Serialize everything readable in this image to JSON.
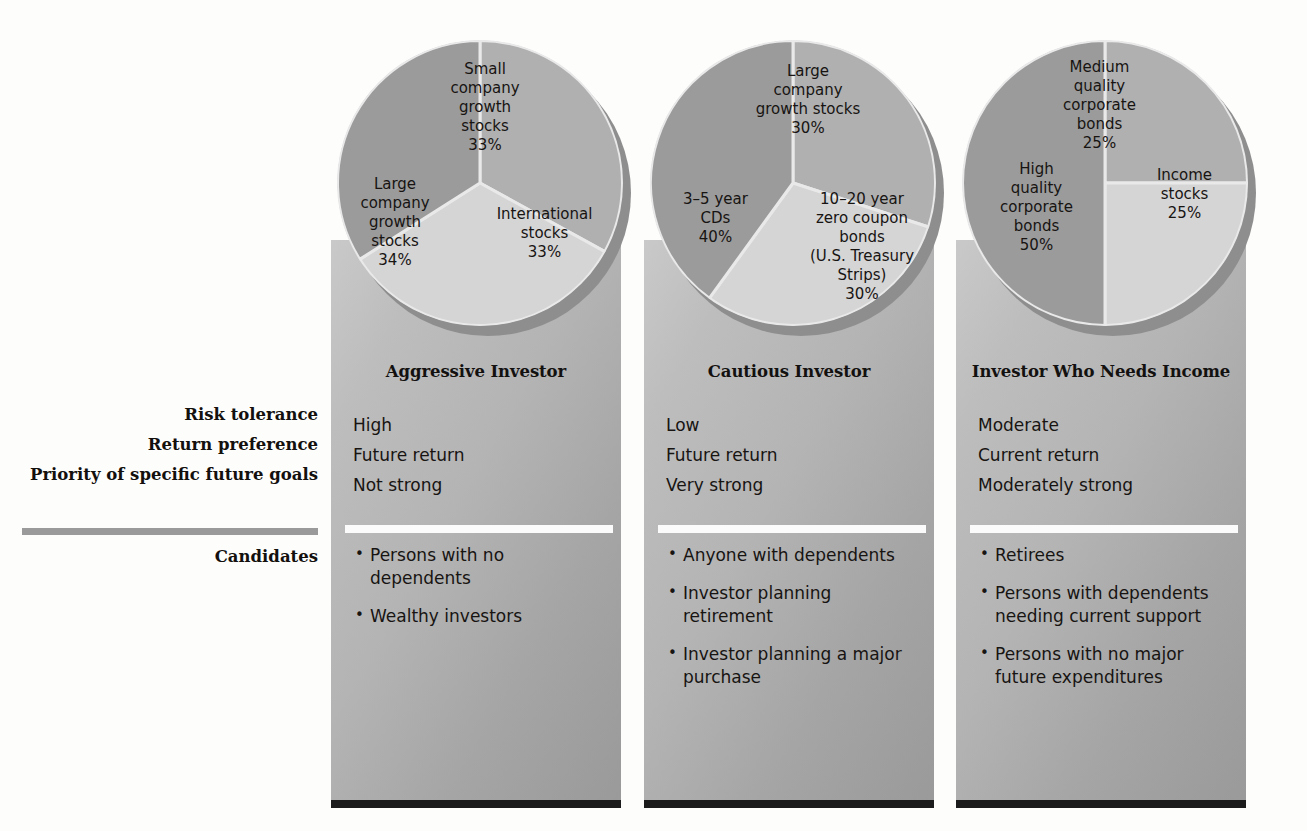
{
  "row_labels": [
    "Risk tolerance",
    "Return preference",
    "Priority of specific future goals"
  ],
  "candidates_label": "Candidates",
  "colors": {
    "slice_dark": "#9b9b9b",
    "slice_mid": "#b0b0b0",
    "slice_light": "#d5d5d5",
    "panel_top": "#c9c9c9",
    "panel_bottom": "#9a9a9a",
    "shadow": "#1b1b1b",
    "rule_gray": "#9a9a9a",
    "rule_white": "#fbfbfb",
    "text": "#171412"
  },
  "chart_data": [
    {
      "type": "pie",
      "title": "Aggressive Investor",
      "categories": [
        "Small company growth stocks",
        "International stocks",
        "Large company growth stocks"
      ],
      "values": [
        33,
        33,
        34
      ],
      "labels": [
        "Small\ncompany\ngrowth\nstocks\n33%",
        "International\nstocks\n33%",
        "Large\ncompany\ngrowth\nstocks\n34%"
      ],
      "value_labels": [
        "33%",
        "33%",
        "34%"
      ],
      "colors": [
        "#b0b0b0",
        "#d5d5d5",
        "#9b9b9b"
      ],
      "legend": "none",
      "grid": false
    },
    {
      "type": "pie",
      "title": "Cautious Investor",
      "categories": [
        "Large company growth stocks",
        "10–20 year zero coupon bonds (U.S. Treasury Strips)",
        "3–5 year CDs"
      ],
      "values": [
        30,
        30,
        40
      ],
      "labels": [
        "Large\ncompany\ngrowth stocks\n30%",
        "10–20 year\nzero coupon\nbonds\n(U.S. Treasury\nStrips)\n30%",
        "3–5 year\nCDs\n40%"
      ],
      "value_labels": [
        "30%",
        "30%",
        "40%"
      ],
      "colors": [
        "#b0b0b0",
        "#d5d5d5",
        "#9b9b9b"
      ],
      "legend": "none",
      "grid": false
    },
    {
      "type": "pie",
      "title": "Investor Who Needs Income",
      "categories": [
        "Medium quality corporate bonds",
        "Income stocks",
        "High quality corporate bonds"
      ],
      "values": [
        25,
        25,
        50
      ],
      "labels": [
        "Medium\nquality\ncorporate\nbonds\n25%",
        "Income\nstocks\n25%",
        "High\nquality\ncorporate\nbonds\n50%"
      ],
      "value_labels": [
        "25%",
        "25%",
        "50%"
      ],
      "colors": [
        "#b0b0b0",
        "#d5d5d5",
        "#9b9b9b"
      ],
      "legend": "none",
      "grid": false
    }
  ],
  "columns": [
    {
      "title": "Aggressive Investor",
      "risk_tolerance": "High",
      "return_preference": "Future return",
      "priority": "Not strong",
      "candidates": [
        "Persons with no dependents",
        "Wealthy investors"
      ]
    },
    {
      "title": "Cautious Investor",
      "risk_tolerance": "Low",
      "return_preference": "Future return",
      "priority": "Very strong",
      "candidates": [
        "Anyone with dependents",
        "Investor planning retirement",
        "Investor planning a major purchase"
      ]
    },
    {
      "title": "Investor Who Needs Income",
      "risk_tolerance": "Moderate",
      "return_preference": "Current return",
      "priority": "Moderately strong",
      "candidates": [
        "Retirees",
        "Persons with dependents needing current support",
        "Persons with no major future expenditures"
      ]
    }
  ]
}
